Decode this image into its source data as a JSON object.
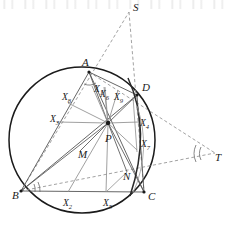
{
  "figure": {
    "type": "euclidean-geometry-diagram",
    "colors": {
      "circle_stroke": "#1a1a1a",
      "solid_line": "#5a5a5a",
      "dashed_line": "#8a8a8a",
      "chord_line": "#2a2a2a",
      "label_text": "#1a1a1a",
      "background": "#ffffff"
    },
    "vertices": [
      {
        "name": "A",
        "label": "A",
        "x": 89.0,
        "y": 72.0,
        "label_x": 82.0,
        "label_y": 66.0
      },
      {
        "name": "B",
        "label": "B",
        "x": 21.0,
        "y": 191.0,
        "label_x": 12.0,
        "label_y": 199.0
      },
      {
        "name": "C",
        "label": "C",
        "x": 144.0,
        "y": 192.0,
        "label_x": 148.0,
        "label_y": 200.0
      },
      {
        "name": "D",
        "label": "D",
        "x": 137.0,
        "y": 95.0,
        "label_x": 142.0,
        "label_y": 91.0
      },
      {
        "name": "S",
        "label": "S",
        "x": 129.0,
        "y": 12.0,
        "label_x": 133.0,
        "label_y": 11.0
      },
      {
        "name": "T",
        "label": "T",
        "x": 215.0,
        "y": 153.0,
        "label_x": 215.0,
        "label_y": 161.0
      },
      {
        "name": "P",
        "label": "P",
        "x": 108.0,
        "y": 123.0,
        "label_x": 105.0,
        "label_y": 142.0
      },
      {
        "name": "M",
        "label": "M",
        "x": 80.0,
        "y": 151.0,
        "label_x": 78.0,
        "label_y": 158.0
      },
      {
        "name": "N",
        "label": "N",
        "x": 127.0,
        "y": 172.0,
        "label_x": 123.0,
        "label_y": 180.0
      }
    ],
    "foot_labels": [
      {
        "name": "X1",
        "base": "X",
        "sub": "1",
        "x": 94.0,
        "y": 92.0
      },
      {
        "name": "X2",
        "base": "X",
        "sub": "2",
        "x": 63.0,
        "y": 206.0
      },
      {
        "name": "X3",
        "base": "X",
        "sub": "3",
        "x": 50.0,
        "y": 122.0
      },
      {
        "name": "X4",
        "base": "X",
        "sub": "4",
        "x": 140.0,
        "y": 126.0
      },
      {
        "name": "X5",
        "base": "X",
        "sub": "5",
        "x": 103.0,
        "y": 206.0
      },
      {
        "name": "X6",
        "base": "X",
        "sub": "6",
        "x": 100.0,
        "y": 97.0
      },
      {
        "name": "X7",
        "base": "X",
        "sub": "7",
        "x": 141.0,
        "y": 147.0
      },
      {
        "name": "X8",
        "base": "X",
        "sub": "8",
        "x": 62.0,
        "y": 100.0
      },
      {
        "name": "X9",
        "base": "X",
        "sub": "9",
        "x": 114.0,
        "y": 100.0
      }
    ],
    "circle": {
      "cx": 82.0,
      "cy": 140.0,
      "r": 73.0
    },
    "angle_marks": [
      {
        "name": "angle-at-B-outer",
        "vertex": "B"
      },
      {
        "name": "angle-at-B-inner",
        "vertex": "B"
      },
      {
        "name": "angle-at-A",
        "vertex": "A"
      },
      {
        "name": "angle-at-T-outer",
        "vertex": "T"
      },
      {
        "name": "angle-at-T-inner",
        "vertex": "T"
      }
    ],
    "arcs": [
      {
        "name": "arc-through-D-right"
      },
      {
        "name": "arc-through-X7"
      }
    ]
  }
}
